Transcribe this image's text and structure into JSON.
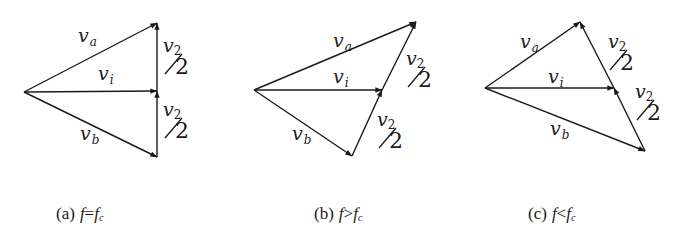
{
  "figure": {
    "panels": [
      {
        "id": "a",
        "caption": {
          "prefix": "(a)",
          "var": "f",
          "rel": "=",
          "var2": "f",
          "sub": "c"
        },
        "points": {
          "origin": [
            24,
            92
          ],
          "top": [
            157,
            23
          ],
          "mid": [
            157,
            91
          ],
          "bottom": [
            157,
            157
          ]
        },
        "labels": {
          "va": {
            "main": "v",
            "sub": "a",
            "pos": [
              78,
              42
            ]
          },
          "vi": {
            "main": "v",
            "sub": "i",
            "pos": [
              98,
              80
            ]
          },
          "vb": {
            "main": "v",
            "sub": "b",
            "pos": [
              80,
              140
            ]
          },
          "half_top": {
            "main": "v",
            "sub": "2",
            "den": "2",
            "pos": [
              163,
              52
            ]
          },
          "half_bot": {
            "main": "v",
            "sub": "2",
            "den": "2",
            "pos": [
              163,
              116
            ]
          }
        }
      },
      {
        "id": "b",
        "caption": {
          "prefix": "(b)",
          "var": "f",
          "rel": ">",
          "var2": "f",
          "sub": "c"
        },
        "points": {
          "origin": [
            254,
            90
          ],
          "top": [
            416,
            22
          ],
          "mid": [
            382,
            90
          ],
          "bottom": [
            352,
            156
          ]
        },
        "labels": {
          "va": {
            "main": "v",
            "sub": "a",
            "pos": [
              333,
              47
            ]
          },
          "vi": {
            "main": "v",
            "sub": "i",
            "pos": [
              333,
              83
            ]
          },
          "vb": {
            "main": "v",
            "sub": "b",
            "pos": [
              292,
              140
            ]
          },
          "half_top": {
            "main": "v",
            "sub": "2",
            "den": "2",
            "pos": [
              406,
              65
            ]
          },
          "half_bot": {
            "main": "v",
            "sub": "2",
            "den": "2",
            "pos": [
              377,
              126
            ]
          }
        }
      },
      {
        "id": "c",
        "caption": {
          "prefix": "(c)",
          "var": "f",
          "rel": "<",
          "var2": "f",
          "sub": "c"
        },
        "points": {
          "origin": [
            485,
            88
          ],
          "top": [
            580,
            22
          ],
          "mid": [
            614,
            88
          ],
          "bottom": [
            645,
            151
          ]
        },
        "labels": {
          "va": {
            "main": "v",
            "sub": "a",
            "pos": [
              520,
              48
            ]
          },
          "vi": {
            "main": "v",
            "sub": "i",
            "pos": [
              548,
              83
            ]
          },
          "vb": {
            "main": "v",
            "sub": "b",
            "pos": [
              550,
              135
            ]
          },
          "half_top": {
            "main": "v",
            "sub": "2",
            "den": "2",
            "pos": [
              608,
              48
            ]
          },
          "half_bot": {
            "main": "v",
            "sub": "2",
            "den": "2",
            "pos": [
              635,
              98
            ]
          }
        }
      }
    ],
    "caption_y": 219,
    "caption_x": [
      56,
      314,
      528
    ],
    "stroke_color": "#1a1a1a",
    "background": "#ffffff"
  }
}
